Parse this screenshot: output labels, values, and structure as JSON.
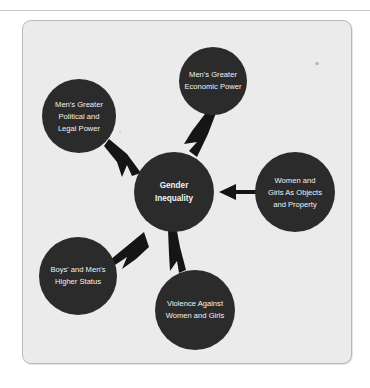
{
  "figure": {
    "type": "concept-map",
    "center_node": {
      "id": "gender-inequality",
      "lines": [
        "Gender",
        "Inequality"
      ],
      "bold": true
    },
    "outer_nodes": [
      {
        "id": "mens-greater-economic-power",
        "position": "top",
        "lines": [
          "Men's Greater",
          "Economic Power"
        ]
      },
      {
        "id": "mens-greater-political-and-legal-power",
        "position": "top-left",
        "lines": [
          "Men's Greater",
          "Political and",
          "Legal Power"
        ]
      },
      {
        "id": "women-and-girls-as-objects-and-property",
        "position": "right",
        "lines": [
          "Women and",
          "Girls As Objects",
          "and Property"
        ]
      },
      {
        "id": "boys-and-mens-higher-status",
        "position": "bottom-left",
        "lines": [
          "Boys' and Men's",
          "Higher Status"
        ]
      },
      {
        "id": "violence-against-women-and-girls",
        "position": "bottom",
        "lines": [
          "Violence Against",
          "Women and Girls"
        ]
      }
    ],
    "arrows": [
      {
        "id": "arrow-from-political-legal-power",
        "from": "mens-greater-political-and-legal-power",
        "to": "gender-inequality",
        "direction": "down-right"
      },
      {
        "id": "arrow-from-economic-power",
        "from": "mens-greater-economic-power",
        "to": "gender-inequality",
        "direction": "down-left"
      },
      {
        "id": "arrow-from-objects-and-property",
        "from": "women-and-girls-as-objects-and-property",
        "to": "gender-inequality",
        "direction": "left"
      },
      {
        "id": "arrow-from-higher-status",
        "from": "boys-and-mens-higher-status",
        "to": "gender-inequality",
        "direction": "up-right"
      },
      {
        "id": "arrow-from-violence",
        "from": "violence-against-women-and-girls",
        "to": "gender-inequality",
        "direction": "up"
      }
    ],
    "colors": {
      "node_fill": "#2b2b2b",
      "node_text": "#f2f2f2",
      "arrow_fill": "#151515",
      "panel_background": "#ececec",
      "panel_border": "#b9b9b9",
      "page_background": "#ffffff",
      "rule": "#c9c9c9"
    }
  }
}
